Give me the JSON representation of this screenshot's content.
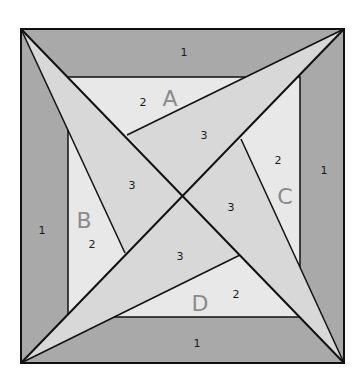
{
  "diagram": {
    "colors": {
      "outer_band": "#a9a9a9",
      "inner_square": "#e8e8e8",
      "star_points": "#d8d8d8",
      "line": "#111111",
      "letter": "#8a8a8a"
    },
    "band_labels": {
      "top": "1",
      "right": "1",
      "bottom": "1",
      "left": "1"
    },
    "sections": {
      "A": {
        "letter": "A",
        "piece2": "2",
        "piece3": "3"
      },
      "B": {
        "letter": "B",
        "piece2": "2",
        "piece3": "3"
      },
      "C": {
        "letter": "C",
        "piece2": "2",
        "piece3": "3"
      },
      "D": {
        "letter": "D",
        "piece2": "2",
        "piece3": "3"
      }
    }
  }
}
